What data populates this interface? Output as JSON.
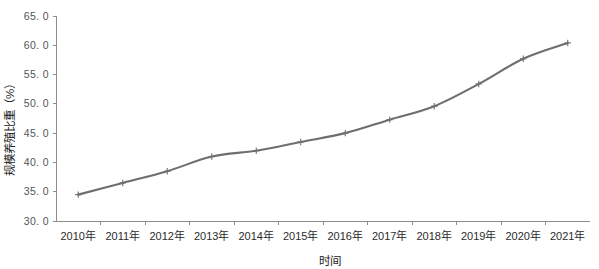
{
  "chart_data": {
    "type": "line",
    "title": "",
    "subtitle": "",
    "xlabel": "时间",
    "ylabel": "规模养殖比重（%）",
    "categories": [
      "2010年",
      "2011年",
      "2012年",
      "2013年",
      "2014年",
      "2015年",
      "2016年",
      "2017年",
      "2018年",
      "2019年",
      "2020年",
      "2021年"
    ],
    "series": [
      {
        "name": "规模养殖比重",
        "values": [
          34.5,
          36.5,
          38.5,
          41.0,
          42.0,
          43.5,
          45.0,
          47.3,
          49.6,
          53.4,
          57.7,
          60.4
        ],
        "color": "#6e6e6e",
        "marker": "plus"
      }
    ],
    "ylim": [
      30.0,
      65.0
    ],
    "ytick_labels": [
      "30. 0",
      "35. 0",
      "40. 0",
      "45. 0",
      "50. 0",
      "55. 0",
      "60. 0",
      "65. 0"
    ],
    "ytick_values": [
      30.0,
      35.0,
      40.0,
      45.0,
      50.0,
      55.0,
      60.0,
      65.0
    ],
    "grid": false,
    "legend": false,
    "legend_position": "none",
    "axis_color": "#8d8d8d",
    "background": "#ffffff"
  }
}
